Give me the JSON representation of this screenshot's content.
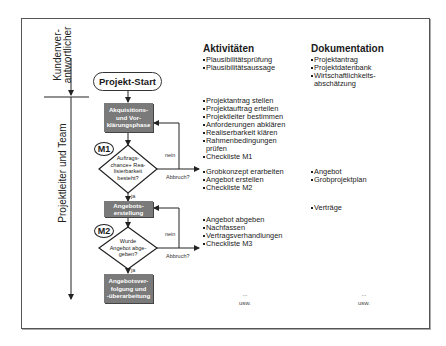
{
  "lanes": {
    "customer": {
      "line1": "Kundenver-",
      "line2": "antwortlicher"
    },
    "team": {
      "label": "Projektleiter und Team"
    }
  },
  "flow": {
    "start": "Projekt-Start",
    "step1": {
      "line1": "Akquisitions-",
      "line2": "und Vor-",
      "line3": "klärungsphase"
    },
    "milestone1": {
      "label": "M1",
      "question_line1": "Auftrags-",
      "question_line2": "chance+ Rea-",
      "question_line3": "lisierbarkeit",
      "question_line4": "besteht?",
      "no": "nein",
      "abort": "Abbruch?",
      "yes": "ja"
    },
    "step2": {
      "line1": "Angebots-",
      "line2": "erstellung"
    },
    "milestone2": {
      "label": "M2",
      "question_line1": "Wurde",
      "question_line2": "Angebot abge-",
      "question_line3": "geben?",
      "no": "nein",
      "abort": "Abbruch?",
      "yes": "ja"
    },
    "step3": {
      "line1": "Angebotsver-",
      "line2": "folgung und",
      "line3": "-überarbeitung"
    }
  },
  "activities": {
    "header": "Aktivitäten",
    "group1": [
      "Plausibilitätsprüfung",
      "Plausibilitätsaussage"
    ],
    "group2": [
      "Projektantrag stellen",
      "Projektauftrag erteilen",
      "Projektleiter bestimmen",
      "Anforderungen abklären",
      "Realiserbarkeit klären",
      "Rahmenbedingungen",
      "prüfen",
      "Checkliste M1"
    ],
    "group3": [
      "Grobkonzept erarbeiten",
      "Angebot erstellen",
      "Checkliste M2"
    ],
    "group4": [
      "Angebot abgeben",
      "Nachfassen",
      "Vertragsverhandlungen",
      "Checkliste M3"
    ],
    "ellipsis": "...",
    "etc": "usw."
  },
  "documentation": {
    "header": "Dokumentation",
    "group1": [
      "Projektantrag",
      "Projektdatenbank",
      "Wirtschaftlichkeits-",
      "abschätzung"
    ],
    "group2": [
      "Angebot",
      "Grobprojektplan"
    ],
    "group3": [
      "Verträge"
    ],
    "ellipsis": "...",
    "etc": "usw."
  },
  "colors": {
    "process_box": "#7a7a7a",
    "frame": "#555555",
    "line": "#222222"
  }
}
